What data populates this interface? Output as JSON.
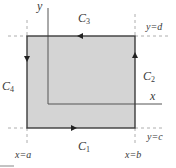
{
  "diagram": {
    "type": "rectangular-region-boundary",
    "colors": {
      "region_fill": "#d4d4d4",
      "boundary_stroke": "#3c3c3c",
      "axis_stroke": "#555555",
      "dashed_guide": "#9a9a9a",
      "label_color": "#3a3a3a"
    },
    "axes": {
      "x_label": "x",
      "y_label": "y"
    },
    "bounds": {
      "left": "x=a",
      "right": "x=b",
      "bottom": "y=c",
      "top": "y=d"
    },
    "curves": [
      {
        "id": "C1",
        "letter": "C",
        "subscript": "1",
        "edge": "bottom",
        "direction": "right"
      },
      {
        "id": "C2",
        "letter": "C",
        "subscript": "2",
        "edge": "right",
        "direction": "up"
      },
      {
        "id": "C3",
        "letter": "C",
        "subscript": "3",
        "edge": "top",
        "direction": "left"
      },
      {
        "id": "C4",
        "letter": "C",
        "subscript": "4",
        "edge": "left",
        "direction": "down"
      }
    ]
  }
}
